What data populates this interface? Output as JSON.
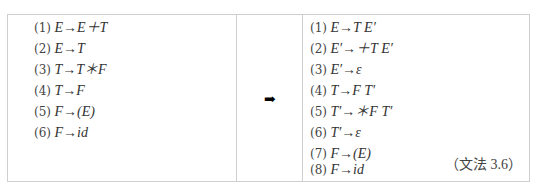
{
  "left_grammar": {
    "rules": [
      {
        "num": "(1)",
        "text": "E→E＋T"
      },
      {
        "num": "(2)",
        "text": "E→T"
      },
      {
        "num": "(3)",
        "text": "T→T＊F"
      },
      {
        "num": "(4)",
        "text": "T→F"
      },
      {
        "num": "(5)",
        "text": "F→(E)"
      },
      {
        "num": "(6)",
        "text": "F→id"
      }
    ]
  },
  "transform_arrow": "➡",
  "right_grammar": {
    "rules": [
      {
        "num": "(1)",
        "text": "E→T E′"
      },
      {
        "num": "(2)",
        "text": "E′→＋T E′"
      },
      {
        "num": "(3)",
        "text": "E′→ε"
      },
      {
        "num": "(4)",
        "text": "T→F T′"
      },
      {
        "num": "(5)",
        "text": "T′→＊F T′"
      },
      {
        "num": "(6)",
        "text": "T′→ε"
      },
      {
        "num": "(7)",
        "text": "F→(E)"
      },
      {
        "num": "(8)",
        "text": "F→id"
      }
    ],
    "label": "（文法 3.6）"
  }
}
